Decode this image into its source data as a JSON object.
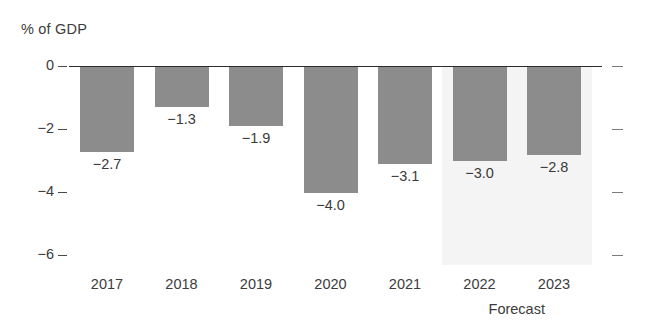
{
  "chart_data": {
    "type": "bar",
    "title": "",
    "ylabel": "% of GDP",
    "xlabel": "",
    "categories": [
      "2017",
      "2018",
      "2019",
      "2020",
      "2021",
      "2022",
      "2023"
    ],
    "values": [
      -2.7,
      -1.3,
      -1.9,
      -4.0,
      -3.1,
      -3.0,
      -2.8
    ],
    "value_labels": [
      "−2.7",
      "−1.3",
      "−1.9",
      "−4.0",
      "−3.1",
      "−3.0",
      "−2.8"
    ],
    "ylim": [
      -6,
      0
    ],
    "yticks": [
      0,
      -2,
      -4,
      -6
    ],
    "ytick_labels": [
      "0",
      "−2",
      "−4",
      "−6"
    ],
    "grid": false,
    "legend": null,
    "annotations": [
      {
        "text": "Forecast",
        "covers": [
          "2022",
          "2023"
        ],
        "style": "shaded-band"
      }
    ],
    "series_color": "#8c8c8c",
    "forecast_band_color": "#f4f4f4"
  },
  "axis": {
    "y_title": "% of GDP"
  },
  "forecast": {
    "caption": "Forecast"
  }
}
